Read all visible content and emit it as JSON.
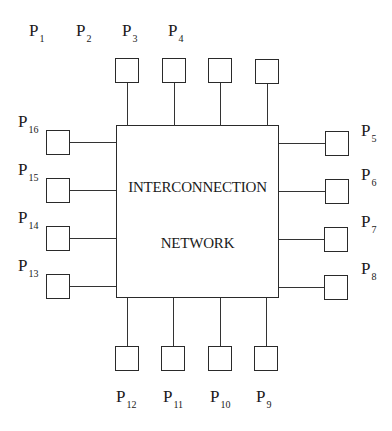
{
  "diagram": {
    "title_line1": "INTERCONNECTION",
    "title_line2": "NETWORK",
    "processor_prefix": "P",
    "top": [
      {
        "sub": "1"
      },
      {
        "sub": "2"
      },
      {
        "sub": "3"
      },
      {
        "sub": "4"
      }
    ],
    "right": [
      {
        "sub": "5"
      },
      {
        "sub": "6"
      },
      {
        "sub": "7"
      },
      {
        "sub": "8"
      }
    ],
    "bottom": [
      {
        "sub": "12"
      },
      {
        "sub": "11"
      },
      {
        "sub": "10"
      },
      {
        "sub": "9"
      }
    ],
    "left": [
      {
        "sub": "16"
      },
      {
        "sub": "15"
      },
      {
        "sub": "14"
      },
      {
        "sub": "13"
      }
    ]
  }
}
